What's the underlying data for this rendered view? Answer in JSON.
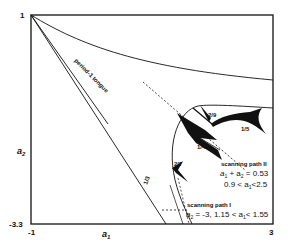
{
  "figure": {
    "axes": {
      "x_label": "a",
      "x_label_sub": "1",
      "y_label": "a",
      "y_label_sub": "2",
      "x_min_label": "-1",
      "x_max_label": "3",
      "y_min_label": "-3.3",
      "y_max_label": "1"
    },
    "region_labels": {
      "period1_tongue": "period-1 tongue",
      "tongue_1_3": "1/3",
      "tongue_2_7": "2/7",
      "tongue_1_4": "1/4",
      "tongue_3_13": "3/13",
      "tongue_2_9": "2/9",
      "tongue_1_5": "1/5"
    },
    "scanning_path_2": {
      "title": "scanning path II",
      "eq_a": "a",
      "eq_sub1": "1",
      "eq_mid": " + a",
      "eq_sub2": "2",
      "eq_end": " = 0.53",
      "range_start": "0.9 < a",
      "range_sub": "1",
      "range_end": "<2.5"
    },
    "scanning_path_1": {
      "title": "scanning path I",
      "eq_a": "a",
      "eq_sub": "2",
      "eq_mid": " = -3, 1.15 < a",
      "eq_sub2": "1",
      "eq_end": "< 1.55"
    },
    "colors": {
      "ink": "#111111",
      "background": "#ffffff"
    }
  }
}
